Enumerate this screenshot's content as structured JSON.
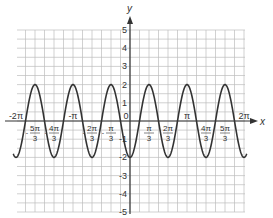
{
  "chart_data": {
    "type": "line",
    "title": "",
    "xlabel": "x",
    "ylabel": "y",
    "function": "y = -2cos(3x)",
    "xlim": [
      -6.2832,
      6.2832
    ],
    "ylim": [
      -5,
      5
    ],
    "grid": true,
    "x_ticks": [
      {
        "value": -6.2832,
        "num": "-2π",
        "den": ""
      },
      {
        "value": -5.236,
        "num": "5π",
        "den": "3",
        "neg": true
      },
      {
        "value": -4.1888,
        "num": "4π",
        "den": "3",
        "neg": true
      },
      {
        "value": -3.1416,
        "num": "-π",
        "den": ""
      },
      {
        "value": -2.0944,
        "num": "2π",
        "den": "3",
        "neg": true
      },
      {
        "value": -1.0472,
        "num": "π",
        "den": "3",
        "neg": true
      },
      {
        "value": 0,
        "num": "0",
        "den": ""
      },
      {
        "value": 1.0472,
        "num": "π",
        "den": "3"
      },
      {
        "value": 2.0944,
        "num": "2π",
        "den": "3"
      },
      {
        "value": 3.1416,
        "num": "π",
        "den": ""
      },
      {
        "value": 4.1888,
        "num": "4π",
        "den": "3"
      },
      {
        "value": 5.236,
        "num": "5π",
        "den": "3"
      },
      {
        "value": 6.2832,
        "num": "2π",
        "den": ""
      }
    ],
    "y_ticks": [
      5,
      4,
      3,
      2,
      1,
      -1,
      -2,
      -3,
      -4,
      -5
    ],
    "amplitude": 2,
    "period": "2π/3",
    "minima_x": [
      "-2π",
      "-4π/3",
      "-2π/3",
      "0",
      "2π/3",
      "4π/3",
      "2π"
    ],
    "maxima_x": [
      "-5π/3",
      "-π",
      "-π/3",
      "π/3",
      "π",
      "5π/3"
    ],
    "series": [
      {
        "name": "y = -2cos(3x)",
        "color": "#333333"
      }
    ]
  },
  "labels": {
    "x_axis": "x",
    "y_axis": "y"
  }
}
